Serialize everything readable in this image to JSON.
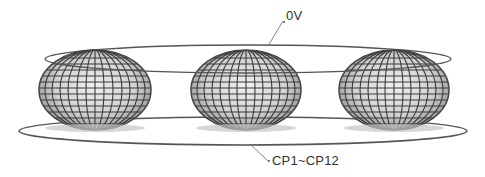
{
  "diagram": {
    "labels": {
      "top_ring": "0V",
      "bottom_ring": "CP1~CP12"
    },
    "colors": {
      "ring_stroke": "#555555",
      "mesh_line": "#3a3a3a",
      "mesh_fill_light": "#e6e6e6",
      "mesh_fill_dark": "#8a8a8a",
      "label_text": "#333333"
    },
    "elements": {
      "top_ring": {
        "cx": 248,
        "cy": 59,
        "rx": 203,
        "ry": 14
      },
      "bottom_ring": {
        "cx": 243,
        "cy": 131,
        "rx": 224,
        "ry": 14
      },
      "spheres": [
        {
          "name": "sphere-left",
          "cx": 95,
          "cy": 90,
          "rx": 56,
          "ry": 40
        },
        {
          "name": "sphere-center",
          "cx": 246,
          "cy": 90,
          "rx": 55,
          "ry": 40
        },
        {
          "name": "sphere-right",
          "cx": 394,
          "cy": 90,
          "rx": 55,
          "ry": 40
        }
      ]
    }
  }
}
